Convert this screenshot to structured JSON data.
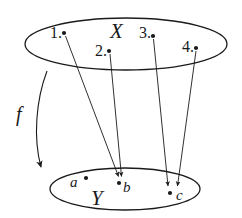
{
  "diagram": {
    "kind": "function-mapping-diagram",
    "colors": {
      "ink": "#1a1a1a",
      "background": "#ffffff"
    },
    "domain_set": {
      "name": "X",
      "label": "X",
      "elements": [
        {
          "key": "1",
          "label": "1.",
          "dot_x": 64,
          "dot_y": 33,
          "label_x": 51,
          "label_y": 37
        },
        {
          "key": "2",
          "label": "2.",
          "dot_x": 109,
          "dot_y": 51,
          "label_x": 95,
          "label_y": 55
        },
        {
          "key": "3",
          "label": "3.",
          "dot_x": 153,
          "dot_y": 36,
          "label_x": 140,
          "label_y": 37
        },
        {
          "key": "4",
          "label": "4.",
          "dot_x": 196,
          "dot_y": 48,
          "label_x": 182,
          "label_y": 50
        }
      ]
    },
    "codomain_set": {
      "name": "Y",
      "label": "Y",
      "elements": [
        {
          "key": "a",
          "label": "a",
          "dot_x": 86,
          "dot_y": 179,
          "label_x": 71,
          "label_y": 189
        },
        {
          "key": "b",
          "label": "b",
          "dot_x": 120,
          "dot_y": 183,
          "label_x": 124,
          "label_y": 194
        },
        {
          "key": "c",
          "label": "c",
          "dot_x": 171,
          "dot_y": 193,
          "label_x": 177,
          "label_y": 199
        }
      ]
    },
    "mapping_label": "f",
    "mappings": [
      {
        "from": "1",
        "to": "b"
      },
      {
        "from": "2",
        "to": "b"
      },
      {
        "from": "3",
        "to": "c"
      },
      {
        "from": "4",
        "to": "c"
      }
    ],
    "unmapped_codomain_elements": [
      "a"
    ]
  }
}
